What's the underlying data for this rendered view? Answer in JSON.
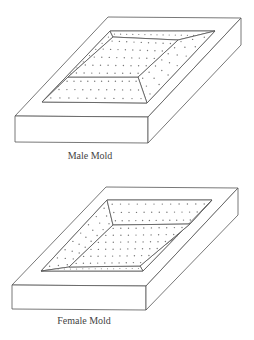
{
  "figures": [
    {
      "id": "male",
      "label": "Male Mold",
      "label_pos": {
        "x": 90,
        "y": 150
      },
      "description": "Block with raised truncated pyramid plateau, perforated surfaces"
    },
    {
      "id": "female",
      "label": "Female Mold",
      "label_pos": {
        "x": 84,
        "y": 315
      },
      "description": "Block with recessed cavity, perforated surfaces"
    }
  ],
  "colors": {
    "stroke": "#555555",
    "dot": "#777777",
    "background": "#ffffff"
  }
}
